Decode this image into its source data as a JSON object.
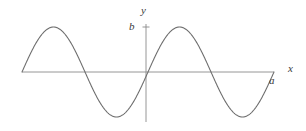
{
  "figure": {
    "background_color": "#ffffff",
    "curve_color": "#6f6f6f",
    "axis_color": "#8a8a8a",
    "label_color": "#3a3a3a"
  },
  "labels": {
    "y_axis": "y",
    "x_axis": "x",
    "amplitude_tick": "b",
    "x_endpoint": "a"
  },
  "chart_data": {
    "type": "line",
    "title": "",
    "xlabel": "x",
    "ylabel": "y",
    "grid": false,
    "legend": null,
    "annotations": [
      {
        "text": "b",
        "meaning": "amplitude tick on y-axis at peak height",
        "x": 0,
        "y": 1
      },
      {
        "text": "a",
        "meaning": "right endpoint of x-axis where curve returns to zero",
        "x": 2,
        "y": 0
      }
    ],
    "axis": {
      "x_axis_pixel_y": 72,
      "x_axis_pixel_start": 22,
      "x_axis_pixel_end": 274,
      "y_axis_pixel_x": 146,
      "y_axis_pixel_top": 24,
      "y_axis_pixel_bottom": 122,
      "xlim": [
        -1,
        2
      ],
      "ylim": [
        -1.12,
        1.12
      ]
    },
    "series": [
      {
        "name": "y = b sin(2πx/a)",
        "periods": 2,
        "amplitude_label": "b",
        "peak_pixel_y": 27,
        "trough_pixel_y": 117,
        "x": [
          -1,
          -0.875,
          -0.75,
          -0.625,
          -0.5,
          -0.375,
          -0.25,
          -0.125,
          0,
          0.125,
          0.25,
          0.375,
          0.5,
          0.625,
          0.75,
          0.875,
          1,
          1.125,
          1.25,
          1.375,
          1.5,
          1.625,
          1.75,
          1.875,
          2
        ],
        "values": [
          0,
          0.707,
          1,
          0.707,
          0,
          -0.707,
          -1,
          -0.707,
          0,
          0.707,
          1,
          0.707,
          0,
          -0.707,
          -1,
          -0.707,
          0,
          0.707,
          1,
          0.707,
          0,
          -0.707,
          -1,
          -0.707,
          0
        ],
        "zero_crossings_x": [
          -1,
          -0.5,
          0,
          0.5,
          1,
          1.5,
          2
        ],
        "crest_x": [
          -0.75,
          0.25,
          1.25
        ],
        "trough_x": [
          -0.25,
          0.75,
          1.75
        ]
      }
    ]
  }
}
